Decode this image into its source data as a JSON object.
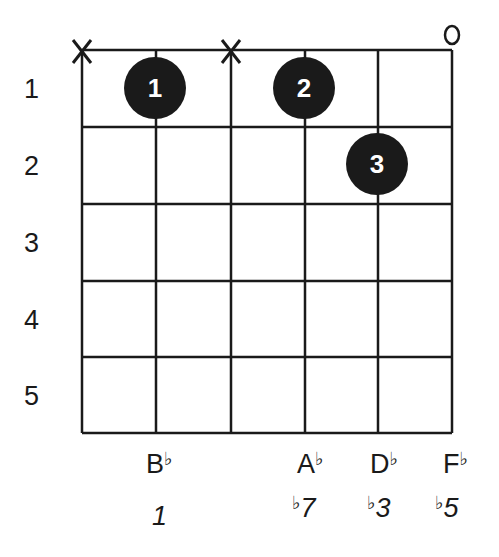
{
  "diagram": {
    "type": "guitar-chord-chart",
    "strings": 6,
    "frets_shown": 5,
    "fret_numbers": [
      "1",
      "2",
      "3",
      "4",
      "5"
    ],
    "string_markers": [
      {
        "string": 1,
        "marker": "X"
      },
      {
        "string": 3,
        "marker": "X"
      },
      {
        "string": 6,
        "marker": "o"
      }
    ],
    "fingers": [
      {
        "string": 2,
        "fret": 1,
        "finger": "1"
      },
      {
        "string": 4,
        "fret": 1,
        "finger": "2"
      },
      {
        "string": 5,
        "fret": 2,
        "finger": "3"
      }
    ],
    "notes": [
      {
        "string": 2,
        "letter": "B",
        "accidental": "♭"
      },
      {
        "string": 4,
        "letter": "A",
        "accidental": "♭"
      },
      {
        "string": 5,
        "letter": "D",
        "accidental": "♭"
      },
      {
        "string": 6,
        "letter": "F",
        "accidental": "♭"
      }
    ],
    "intervals": [
      {
        "string": 2,
        "accidental": "",
        "degree": "1"
      },
      {
        "string": 4,
        "accidental": "♭",
        "degree": "7"
      },
      {
        "string": 5,
        "accidental": "♭",
        "degree": "3"
      },
      {
        "string": 6,
        "accidental": "♭",
        "degree": "5"
      }
    ],
    "colors": {
      "ink": "#1a1a1a",
      "background": "#ffffff",
      "finger_text": "#ffffff"
    }
  }
}
